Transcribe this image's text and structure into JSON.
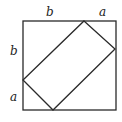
{
  "diagram": {
    "type": "geometry",
    "stroke_color": "#2a2a2a",
    "labels": {
      "top_left_segment": "b",
      "top_right_segment": "a",
      "left_upper_segment": "b",
      "left_lower_segment": "a"
    },
    "outer_square": {
      "x1": 23,
      "y1": 21,
      "x2": 116,
      "y2": 110
    },
    "inner_rectangle": {
      "points": [
        [
          84,
          21
        ],
        [
          115,
          49
        ],
        [
          53,
          110
        ],
        [
          23,
          80
        ]
      ]
    }
  }
}
